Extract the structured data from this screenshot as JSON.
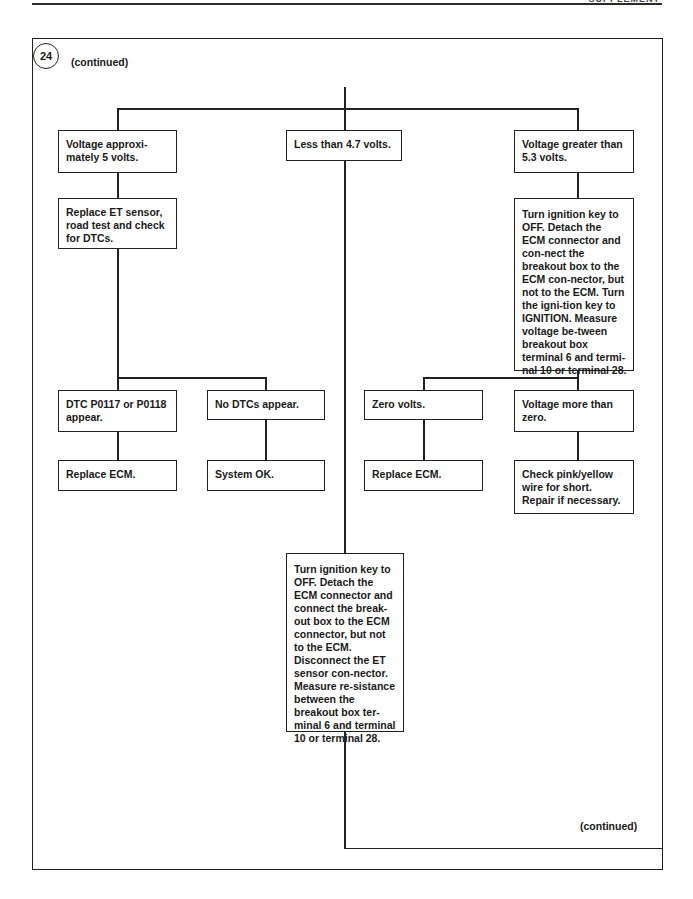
{
  "page": {
    "header_left": "",
    "header_right": "SUPPLEMENT"
  },
  "diagram": {
    "step_number": "24",
    "continued_top": "(continued)",
    "continued_bottom": "(continued)",
    "nodes": {
      "v_approx_5": "Voltage approxi-mately 5 volts.",
      "less_4_7": "Less than 4.7 volts.",
      "greater_5_3": "Voltage greater than 5.3 volts.",
      "replace_et": "Replace ET sensor, road test and check for DTCs.",
      "turn_ign_right": "Turn ignition key to OFF. Detach the ECM connector and con-nect the breakout box to the ECM con-nector, but not to the ECM. Turn the igni-tion key to IGNITION. Measure voltage be-tween breakout box terminal 6 and termi-nal 10 or terminal 28.",
      "dtc_p0117": "DTC P0117 or P0118 appear.",
      "no_dtcs": "No DTCs appear.",
      "zero_volts": "Zero volts.",
      "v_more_zero": "Voltage more than zero.",
      "replace_ecm_left": "Replace ECM.",
      "system_ok": "System OK.",
      "replace_ecm_right": "Replace ECM.",
      "check_pink": "Check pink/yellow wire for short. Repair if necessary.",
      "turn_ign_middle": "Turn ignition key to OFF. Detach the ECM connector and connect the break-out box to the ECM connector, but not to the ECM. Disconnect the ET sensor con-nector. Measure re-sistance between the breakout box ter-minal 6 and terminal 10 or terminal 28."
    }
  }
}
